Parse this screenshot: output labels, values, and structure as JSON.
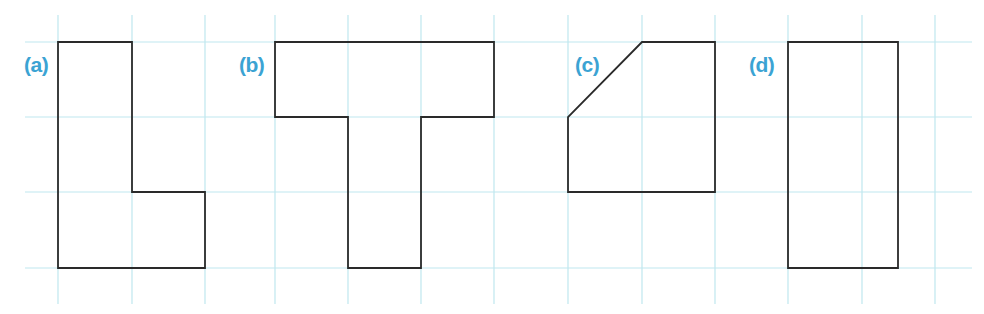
{
  "colors": {
    "grid": "#bfe7ef",
    "outline": "#2a2a2a",
    "label": "#3ba3d3",
    "background": "#ffffff"
  },
  "grid": {
    "x_lines": [
      58,
      132,
      205,
      275,
      348,
      421,
      494,
      568,
      642,
      715,
      788,
      862,
      935
    ],
    "y_lines": [
      42,
      117,
      192,
      268
    ],
    "vertical_extent": [
      15,
      304
    ],
    "horizontal_extent": [
      25,
      972
    ]
  },
  "figures": [
    {
      "id": "a",
      "label": "(a)",
      "label_pos": [
        24,
        71
      ],
      "shape": "L-shape",
      "points": [
        [
          58,
          42
        ],
        [
          132,
          42
        ],
        [
          132,
          192
        ],
        [
          205,
          192
        ],
        [
          205,
          268
        ],
        [
          58,
          268
        ]
      ]
    },
    {
      "id": "b",
      "label": "(b)",
      "label_pos": [
        239,
        71
      ],
      "shape": "T-shape",
      "points": [
        [
          275,
          42
        ],
        [
          494,
          42
        ],
        [
          494,
          117
        ],
        [
          421,
          117
        ],
        [
          421,
          268
        ],
        [
          348,
          268
        ],
        [
          348,
          117
        ],
        [
          275,
          117
        ]
      ]
    },
    {
      "id": "c",
      "label": "(c)",
      "label_pos": [
        575,
        71
      ],
      "shape": "square with cut corner",
      "points": [
        [
          642,
          42
        ],
        [
          715,
          42
        ],
        [
          715,
          192
        ],
        [
          568,
          192
        ],
        [
          568,
          117
        ]
      ]
    },
    {
      "id": "d",
      "label": "(d)",
      "label_pos": [
        749,
        71
      ],
      "shape": "rectangle",
      "points": [
        [
          788,
          42
        ],
        [
          898,
          42
        ],
        [
          898,
          268
        ],
        [
          788,
          268
        ]
      ]
    }
  ]
}
